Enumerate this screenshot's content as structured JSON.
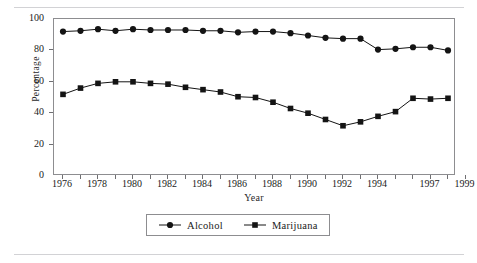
{
  "figure": {
    "y_axis_title": "Percentage",
    "x_axis_title": "Year",
    "legend": {
      "entries": [
        {
          "label": "Alcohol",
          "marker": "circle-marker-icon",
          "color": "#141414"
        },
        {
          "label": "Marijuana",
          "marker": "square-marker-icon",
          "color": "#141414"
        }
      ]
    }
  },
  "chart_data": {
    "type": "line",
    "title": "",
    "subtitle": "",
    "xlabel": "Year",
    "ylabel": "Percentage",
    "xlim": [
      1976,
      1999
    ],
    "ylim": [
      0,
      100
    ],
    "yticks": [
      0,
      20,
      40,
      60,
      80,
      100
    ],
    "xticks": [
      1976,
      1977,
      1978,
      1979,
      1980,
      1981,
      1982,
      1983,
      1984,
      1985,
      1986,
      1987,
      1988,
      1989,
      1990,
      1991,
      1992,
      1993,
      1994,
      1995,
      1996,
      1997,
      1998,
      1999
    ],
    "xtick_labels": [
      "1976",
      "1978",
      "1980",
      "1982",
      "1984",
      "1986",
      "1988",
      "1990",
      "1992",
      "1994",
      "1997",
      "1999"
    ],
    "xtick_label_values": [
      1976,
      1978,
      1980,
      1982,
      1984,
      1986,
      1988,
      1990,
      1992,
      1994,
      1997,
      1999
    ],
    "grid": false,
    "legend_position": "bottom-center",
    "x": [
      1976,
      1977,
      1978,
      1979,
      1980,
      1981,
      1982,
      1983,
      1984,
      1985,
      1986,
      1987,
      1988,
      1989,
      1990,
      1991,
      1992,
      1993,
      1994,
      1995,
      1996,
      1997,
      1998
    ],
    "series": [
      {
        "name": "Alcohol",
        "marker": "circle",
        "color": "#141414",
        "values": [
          92,
          92.5,
          93.5,
          92.5,
          93.5,
          93,
          93,
          93,
          92.5,
          92.5,
          91.5,
          92,
          92,
          91,
          89.5,
          88,
          87.5,
          87.5,
          80.5,
          81,
          82,
          82,
          80
        ]
      },
      {
        "name": "Marijuana",
        "marker": "square",
        "color": "#141414",
        "values": [
          52,
          56,
          59,
          60,
          60,
          59,
          58.5,
          56.5,
          55,
          53.5,
          50.5,
          50,
          47,
          43,
          40,
          36,
          32,
          34.5,
          38,
          41,
          49.5,
          49,
          49.5
        ]
      }
    ]
  }
}
